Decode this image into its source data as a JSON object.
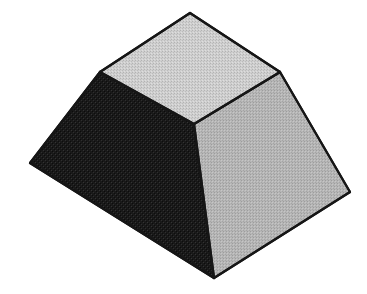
{
  "figure": {
    "name": "truncated-pyramid",
    "background_color": "#ffffff",
    "outline_color": "#1a1a1a",
    "outline_width": 2.2,
    "canvas": {
      "width": 367,
      "height": 294
    },
    "projection": "isometric",
    "texture": "halftone-dither-grain",
    "faces": [
      {
        "id": "top-face",
        "label": "Top face",
        "fill_color": "#c8c8c8",
        "points": "190,13 280,72 194,124 100,72",
        "vertices": [
          {
            "name": "top-back",
            "x": 190,
            "y": 13
          },
          {
            "name": "top-right",
            "x": 280,
            "y": 72
          },
          {
            "name": "top-front",
            "x": 194,
            "y": 124
          },
          {
            "name": "top-left",
            "x": 100,
            "y": 72
          }
        ]
      },
      {
        "id": "right-face",
        "label": "Right side face",
        "fill_color": "#b4b4b4",
        "points": "194,124 280,72 350,192 214,278",
        "vertices": [
          {
            "name": "top-front",
            "x": 194,
            "y": 124
          },
          {
            "name": "top-right",
            "x": 280,
            "y": 72
          },
          {
            "name": "bottom-right",
            "x": 350,
            "y": 192
          },
          {
            "name": "bottom-front",
            "x": 214,
            "y": 278
          }
        ]
      },
      {
        "id": "left-face",
        "label": "Left side face",
        "fill_color": "#1c1c1c",
        "points": "100,72 194,124 214,278 30,163",
        "vertices": [
          {
            "name": "top-left",
            "x": 100,
            "y": 72
          },
          {
            "name": "top-front",
            "x": 194,
            "y": 124
          },
          {
            "name": "bottom-front",
            "x": 214,
            "y": 278
          },
          {
            "name": "bottom-left",
            "x": 30,
            "y": 163
          }
        ]
      }
    ],
    "edges": [
      {
        "id": "edge-top-back-left",
        "from": [
          190,
          13
        ],
        "to": [
          100,
          72
        ]
      },
      {
        "id": "edge-top-back-right",
        "from": [
          190,
          13
        ],
        "to": [
          280,
          72
        ]
      },
      {
        "id": "edge-top-left-front",
        "from": [
          100,
          72
        ],
        "to": [
          194,
          124
        ]
      },
      {
        "id": "edge-top-right-front",
        "from": [
          280,
          72
        ],
        "to": [
          194,
          124
        ]
      },
      {
        "id": "edge-vertical-left",
        "from": [
          100,
          72
        ],
        "to": [
          30,
          163
        ]
      },
      {
        "id": "edge-vertical-front",
        "from": [
          194,
          124
        ],
        "to": [
          214,
          278
        ]
      },
      {
        "id": "edge-vertical-right",
        "from": [
          280,
          72
        ],
        "to": [
          350,
          192
        ]
      },
      {
        "id": "edge-base-left",
        "from": [
          30,
          163
        ],
        "to": [
          214,
          278
        ]
      },
      {
        "id": "edge-base-right",
        "from": [
          214,
          278
        ],
        "to": [
          350,
          192
        ]
      }
    ]
  }
}
